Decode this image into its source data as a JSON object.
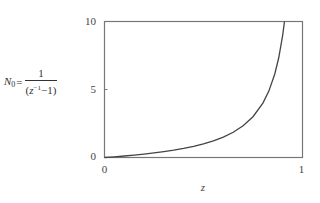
{
  "chart_data": {
    "type": "line",
    "title": "",
    "xlabel": "z",
    "ylabel": "N_0 = 1/(z^-1 - 1)",
    "ylabel_parts": {
      "lhs": "N",
      "lhs_sub": "0",
      "eq": "=",
      "numerator": "1",
      "den_open": "(",
      "den_var": "z",
      "den_exp": "−1",
      "den_rest": "−1)"
    },
    "xlim": [
      0,
      1
    ],
    "ylim": [
      0,
      10
    ],
    "x_ticks": [
      "0",
      "1"
    ],
    "y_ticks": [
      "0",
      "5",
      "10"
    ],
    "grid": false,
    "legend": null,
    "series": [
      {
        "name": "N0",
        "color": "#444444",
        "x": [
          0.0,
          0.05,
          0.1,
          0.15,
          0.2,
          0.25,
          0.3,
          0.35,
          0.4,
          0.45,
          0.5,
          0.55,
          0.6,
          0.65,
          0.7,
          0.75,
          0.8,
          0.83,
          0.86,
          0.88,
          0.9,
          0.909
        ],
        "values": [
          0.0,
          0.053,
          0.111,
          0.176,
          0.25,
          0.333,
          0.429,
          0.538,
          0.667,
          0.818,
          1.0,
          1.222,
          1.5,
          1.857,
          2.333,
          3.0,
          4.0,
          4.882,
          6.143,
          7.333,
          9.0,
          10.0
        ]
      }
    ]
  },
  "colors": {
    "frame": "#777777",
    "curve": "#444444",
    "text": "#444444",
    "background": "#ffffff"
  }
}
